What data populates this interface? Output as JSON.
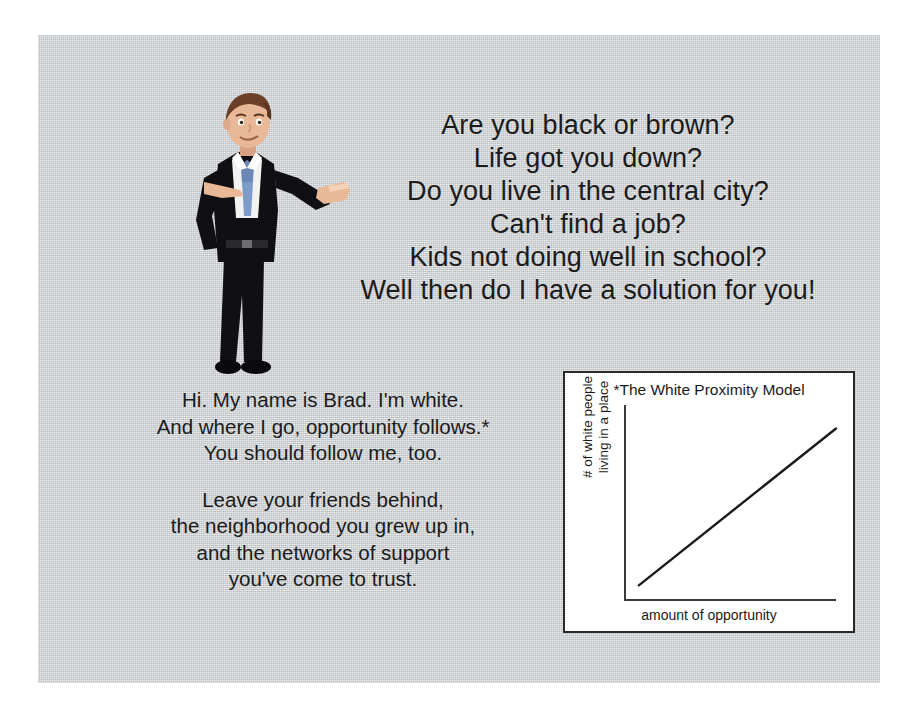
{
  "slide": {
    "background_color": "#c9cdd0",
    "headline_lines": [
      "Are you black or brown?",
      "Life got you down?",
      "Do you live in the central city?",
      "Can't find a job?",
      "Kids not doing well in school?",
      "Well then do I have a solution for you!"
    ],
    "body_paragraph_1": [
      "Hi. My name is Brad. I'm white.",
      "And where I go, opportunity follows.*",
      "You should follow me, too."
    ],
    "body_paragraph_2": [
      "Leave your friends behind,",
      "the neighborhood you grew up in,",
      "and the networks of support",
      "you've come to trust."
    ]
  },
  "illustration": {
    "name": "cartoon-businessman",
    "description": "Cartoon businessman in black suit pointing with one hand and presenting with open palm",
    "suit_color": "#101014",
    "shirt_color": "#f2f2f0",
    "tie_color": "#7e9cc9",
    "skin_color": "#e9b896",
    "hair_color": "#6b3f27"
  },
  "chart_data": {
    "type": "line",
    "title": "*The White Proximity Model",
    "xlabel": "amount of opportunity",
    "ylabel_lines": [
      "# of white people",
      "living in a place"
    ],
    "ylabel": "# of white people living in a place",
    "grid": false,
    "legend": false,
    "axis_tick_labels": [],
    "xlim": [
      0,
      100
    ],
    "ylim": [
      0,
      100
    ],
    "series": [
      {
        "name": "white proximity trend",
        "x": [
          7,
          100
        ],
        "y": [
          8,
          88
        ],
        "color": "#1b1b1b"
      }
    ],
    "border_color": "#2a2a2a",
    "background_color": "#ffffff"
  }
}
